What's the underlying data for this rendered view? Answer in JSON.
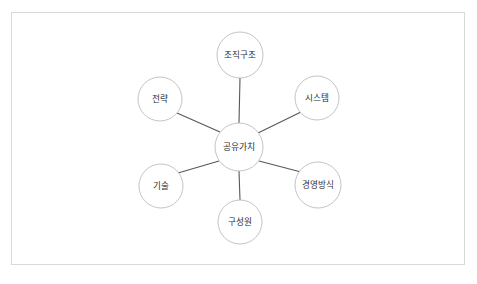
{
  "diagram": {
    "background_color": "#ffffff",
    "border_color": "#d9d9d9",
    "edge_color": "#575757",
    "node_fill": "#ffffff",
    "node_stroke": "#bcbcbc",
    "label_color": "#2e2e2e",
    "center": {
      "label": "공유가치",
      "cx": 239,
      "cy": 147,
      "r": 24
    },
    "nodes": [
      {
        "label": "조직구조",
        "cx": 240,
        "cy": 55,
        "r": 23,
        "position": "top"
      },
      {
        "label": "시스템",
        "cx": 317,
        "cy": 98,
        "r": 22,
        "position": "upper-right"
      },
      {
        "label": "경영방식",
        "cx": 318,
        "cy": 185,
        "r": 23,
        "position": "lower-right"
      },
      {
        "label": "구성원",
        "cx": 240,
        "cy": 222,
        "r": 22,
        "position": "bottom"
      },
      {
        "label": "기술",
        "cx": 161,
        "cy": 186,
        "r": 22,
        "position": "lower-left"
      },
      {
        "label": "전략",
        "cx": 160,
        "cy": 99,
        "r": 22,
        "position": "upper-left"
      }
    ],
    "edges": [
      {
        "from": "공유가치",
        "to": "조직구조",
        "x1": 239,
        "y1": 123,
        "x2": 240,
        "y2": 78
      },
      {
        "from": "공유가치",
        "to": "시스템",
        "x1": 258,
        "y1": 133,
        "x2": 301,
        "y2": 112
      },
      {
        "from": "공유가치",
        "to": "경영방식",
        "x1": 259,
        "y1": 161,
        "x2": 301,
        "y2": 172
      },
      {
        "from": "공유가치",
        "to": "구성원",
        "x1": 239,
        "y1": 171,
        "x2": 240,
        "y2": 200
      },
      {
        "from": "공유가치",
        "to": "기술",
        "x1": 219,
        "y1": 161,
        "x2": 178,
        "y2": 173
      },
      {
        "from": "공유가치",
        "to": "전략",
        "x1": 220,
        "y1": 132,
        "x2": 177,
        "y2": 113
      }
    ]
  }
}
